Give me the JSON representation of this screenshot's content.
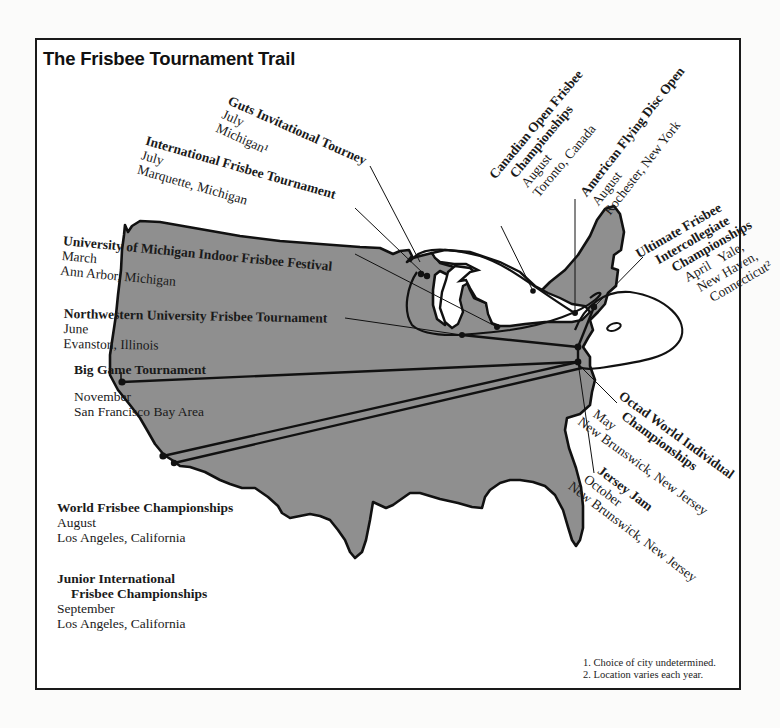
{
  "title": "The Frisbee Tournament Trail",
  "colors": {
    "land": "#8f8f8f",
    "outline": "#111111",
    "background": "#ffffff",
    "text": "#1a1a1a"
  },
  "tournaments": [
    {
      "name": "Guts Invitational Tourney",
      "month": "July",
      "location": "Michigan¹"
    },
    {
      "name": "International Frisbee Tournament",
      "month": "July",
      "location": "Marquette, Michigan"
    },
    {
      "name": "Canadian Open Frisbee Championships",
      "name_line1": "Canadian Open Frisbee",
      "name_line2": "Championships",
      "month": "August",
      "location": "Toronto, Canada"
    },
    {
      "name": "American Flying Disc Open",
      "month": "August",
      "location": "Rochester, New York"
    },
    {
      "name": "University of Michigan Indoor Frisbee Festival",
      "month": "March",
      "location": "Ann Arbor, Michigan"
    },
    {
      "name": "Northwestern University Frisbee Tournament",
      "month": "June",
      "location": "Evanston, Illinois"
    },
    {
      "name": "Big Game Tournament",
      "month": "November",
      "location": "San Francisco Bay Area"
    },
    {
      "name": "Ultimate Frisbee Intercollegiate Championships",
      "name_line1": "Ultimate Frisbee",
      "name_line2": "Intercollegiate",
      "name_line3": "Championships",
      "month": "April",
      "location_line1": "Yale,",
      "location_line2": "New Haven,",
      "location_line3": "Connecticut²"
    },
    {
      "name": "Octad World Individual Championships",
      "name_line1": "Octad World Individual",
      "name_line2": "Championships",
      "month": "May",
      "location": "New Brunswick, New Jersey"
    },
    {
      "name": "Jersey Jam",
      "month": "October",
      "location": "New Brunswick, New Jersey"
    },
    {
      "name": "World Frisbee Championships",
      "month": "August",
      "location": "Los Angeles, California"
    },
    {
      "name": "Junior International Frisbee Championships",
      "name_line1": "Junior International",
      "name_line2": "Frisbee Championships",
      "month": "September",
      "location": "Los Angeles, California"
    }
  ],
  "footnotes": [
    "1. Choice of city undetermined.",
    "2. Location varies each year."
  ]
}
